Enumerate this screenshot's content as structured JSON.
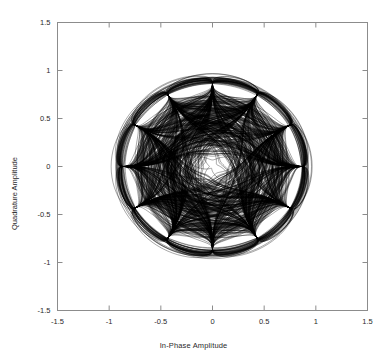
{
  "figure": {
    "background_color": "#ffffff",
    "frame_color": "#8c8c8c",
    "trace_color": "#000000"
  },
  "axis_titles": {
    "x": "In-Phase Amplitude",
    "y": "Quadrature Amplitude"
  },
  "chart_data": {
    "type": "line",
    "title": "",
    "subtitle": "",
    "xlabel": "In-Phase Amplitude",
    "ylabel": "Quadrature Amplitude",
    "xlim": [
      -1.5,
      1.5
    ],
    "ylim": [
      -1.5,
      1.5
    ],
    "xticks": [
      -1.5,
      -1,
      -0.5,
      0,
      0.5,
      1,
      1.5
    ],
    "xtick_labels": [
      "-1.5",
      "-1",
      "-0.5",
      "0",
      "0.5",
      "1",
      "1.5"
    ],
    "yticks": [
      -1.5,
      -1,
      -0.5,
      0,
      0.5,
      1,
      1.5
    ],
    "ytick_labels": [
      "-1.5",
      "-1",
      "-0.5",
      "0",
      "0.5",
      "1",
      "1.5"
    ],
    "grid": false,
    "legend": null,
    "aspect": "equal",
    "symmetry_order": 6,
    "node_radius": 0.87,
    "inner_void_radius": 0.3,
    "node_count": 12,
    "nodes": [
      {
        "index": 0,
        "angle_deg": 0,
        "x": 0.87,
        "y": 0.0
      },
      {
        "index": 1,
        "angle_deg": 30,
        "x": 0.753,
        "y": 0.435
      },
      {
        "index": 2,
        "angle_deg": 60,
        "x": 0.435,
        "y": 0.753
      },
      {
        "index": 3,
        "angle_deg": 90,
        "x": 0.0,
        "y": 0.87
      },
      {
        "index": 4,
        "angle_deg": 120,
        "x": -0.435,
        "y": 0.753
      },
      {
        "index": 5,
        "angle_deg": 150,
        "x": -0.753,
        "y": 0.435
      },
      {
        "index": 6,
        "angle_deg": 180,
        "x": -0.87,
        "y": 0.0
      },
      {
        "index": 7,
        "angle_deg": 210,
        "x": -0.753,
        "y": -0.435
      },
      {
        "index": 8,
        "angle_deg": 240,
        "x": -0.435,
        "y": -0.753
      },
      {
        "index": 9,
        "angle_deg": 270,
        "x": 0.0,
        "y": -0.87
      },
      {
        "index": 10,
        "angle_deg": 300,
        "x": 0.435,
        "y": -0.753
      },
      {
        "index": 11,
        "angle_deg": 330,
        "x": 0.753,
        "y": -0.435
      }
    ],
    "series": [
      {
        "name": "phase trajectories",
        "trace_count": 420,
        "color": "#000000",
        "line_width": 0.42
      }
    ]
  }
}
